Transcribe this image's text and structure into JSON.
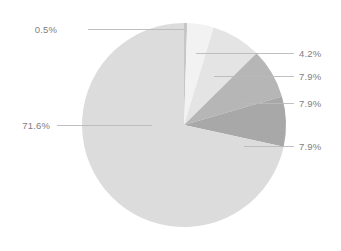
{
  "chart_data": {
    "type": "pie",
    "title": "",
    "subtitle": "",
    "xlabel": "",
    "ylabel": "",
    "legend": "none",
    "grid": false,
    "label_format": "percent",
    "start_angle_deg": 0,
    "direction": "clockwise",
    "center": {
      "x": 184,
      "y": 125
    },
    "radius": 102,
    "categories": [
      "Slice 1",
      "Slice 2",
      "Slice 3",
      "Slice 4",
      "Slice 5",
      "Slice 6"
    ],
    "values": [
      0.5,
      4.2,
      7.9,
      7.9,
      7.9,
      71.6
    ],
    "labels": [
      "0.5%",
      "4.2%",
      "7.9%",
      "7.9%",
      "7.9%",
      "71.6%"
    ],
    "colors": [
      "#c6c6c6",
      "#f2f2f2",
      "#e4e4e4",
      "#b6b6b6",
      "#a8a8a8",
      "#dcdcdc"
    ],
    "slices": [
      {
        "label": "0.5%",
        "value": 0.5,
        "color": "#c6c6c6",
        "start_deg": 0.0,
        "end_deg": 1.8,
        "label_side": "left",
        "label_x": 57,
        "label_y": 25,
        "leader": {
          "x1": 88,
          "y1": 29,
          "x2": 184,
          "y2": 29
        }
      },
      {
        "label": "4.2%",
        "value": 4.2,
        "color": "#f2f2f2",
        "start_deg": 1.8,
        "end_deg": 16.92,
        "label_side": "right",
        "label_x": 299,
        "label_y": 49,
        "leader": {
          "x1": 196,
          "y1": 53,
          "x2": 294,
          "y2": 53
        }
      },
      {
        "label": "7.9%",
        "value": 7.9,
        "color": "#e4e4e4",
        "start_deg": 16.92,
        "end_deg": 45.36,
        "label_side": "right",
        "label_x": 299,
        "label_y": 72,
        "leader": {
          "x1": 214,
          "y1": 76,
          "x2": 294,
          "y2": 76
        }
      },
      {
        "label": "7.9%",
        "value": 7.9,
        "color": "#b6b6b6",
        "start_deg": 45.36,
        "end_deg": 73.8,
        "label_side": "right",
        "label_x": 299,
        "label_y": 99,
        "leader": {
          "x1": 244,
          "y1": 103,
          "x2": 294,
          "y2": 103
        }
      },
      {
        "label": "7.9%",
        "value": 7.9,
        "color": "#a8a8a8",
        "start_deg": 73.8,
        "end_deg": 102.24,
        "label_side": "right",
        "label_x": 299,
        "label_y": 142,
        "leader": {
          "x1": 244,
          "y1": 146,
          "x2": 294,
          "y2": 146
        }
      },
      {
        "label": "71.6%",
        "value": 71.6,
        "color": "#dcdcdc",
        "start_deg": 102.24,
        "end_deg": 360.0,
        "label_side": "left",
        "label_x": 50,
        "label_y": 121,
        "leader": {
          "x1": 57,
          "y1": 125,
          "x2": 152,
          "y2": 125
        }
      }
    ]
  }
}
